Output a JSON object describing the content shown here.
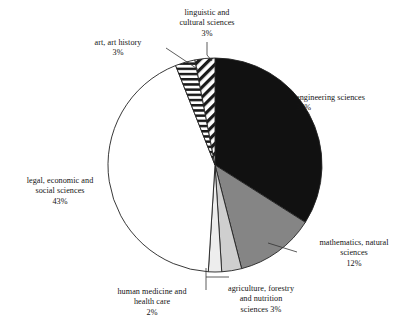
{
  "chart_data": {
    "type": "pie",
    "title": "",
    "subtitle": "",
    "xlabel": "",
    "ylabel": "",
    "legend_position": "none",
    "grid": false,
    "start_angle_deg": 0,
    "direction": "clockwise",
    "categories": [
      "engineering sciences",
      "mathematics, natural sciences",
      "agriculture, forestry and nutrition sciences",
      "human medicine and health care",
      "legal, economic and social sciences",
      "art, art history",
      "linguistic and cultural sciences"
    ],
    "values": [
      34,
      12,
      3,
      2,
      43,
      3,
      3
    ],
    "value_suffix": "%",
    "slices": [
      {
        "name": "engineering sciences",
        "value": 34,
        "value_text": "34%",
        "label_lines": [
          "engineering sciences",
          "34%"
        ],
        "fill": "#111111",
        "pattern": "solid",
        "start_deg": 0,
        "end_deg": 122.4
      },
      {
        "name": "mathematics, natural sciences",
        "value": 12,
        "value_text": "12%",
        "label_lines": [
          "mathematics, natural",
          "sciences",
          "12%"
        ],
        "fill": "#858585",
        "pattern": "solid",
        "start_deg": 122.4,
        "end_deg": 165.6
      },
      {
        "name": "agriculture, forestry and nutrition sciences",
        "value": 3,
        "value_text": "3%",
        "label_lines": [
          "agriculture, forestry",
          "and nutrition",
          "sciences 3%"
        ],
        "fill": "#cfcfcf",
        "pattern": "solid",
        "start_deg": 165.6,
        "end_deg": 176.4
      },
      {
        "name": "human medicine and health care",
        "value": 2,
        "value_text": "2%",
        "label_lines": [
          "human medicine and",
          "health care",
          "2%"
        ],
        "fill": "#ededed",
        "pattern": "solid",
        "start_deg": 176.4,
        "end_deg": 183.6
      },
      {
        "name": "legal, economic and social sciences",
        "value": 43,
        "value_text": "43%",
        "label_lines": [
          "legal, economic and",
          "social sciences",
          "43%"
        ],
        "fill": "#ffffff",
        "pattern": "solid",
        "start_deg": 183.6,
        "end_deg": 338.4
      },
      {
        "name": "art, art history",
        "value": 3,
        "value_text": "3%",
        "label_lines": [
          "art, art history",
          "3%"
        ],
        "fill": "#ffffff",
        "pattern": "horizontal-stripes",
        "start_deg": 338.4,
        "end_deg": 349.2
      },
      {
        "name": "linguistic and cultural sciences",
        "value": 3,
        "value_text": "3%",
        "label_lines": [
          "linguistic and",
          "cultural sciences",
          "3%"
        ],
        "fill": "#ffffff",
        "pattern": "diagonal-stripes",
        "start_deg": 349.2,
        "end_deg": 360
      }
    ],
    "geometry": {
      "center_x": 215,
      "center_y": 165,
      "radius": 107
    },
    "colors": {
      "outline": "#222222",
      "leader_line": "#333333",
      "text": "#141414",
      "background": "#ffffff"
    }
  },
  "labels": {
    "linguistic": "linguistic and\ncultural sciences\n3%",
    "art": "art, art history\n3%",
    "legal": "legal, economic and\nsocial sciences\n43%",
    "engineering": "engineering sciences\n34%",
    "mathematics": "mathematics, natural\nsciences\n12%",
    "agriculture": "agriculture, forestry\nand nutrition\nsciences 3%",
    "human_medicine": "human medicine and\nhealth care\n2%"
  }
}
